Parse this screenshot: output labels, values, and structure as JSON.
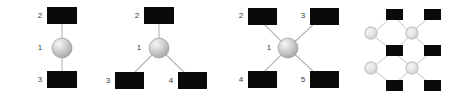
{
  "figure": {
    "background_color": "#ffffff",
    "square_color": "#0a0a0a",
    "sphere_color": "#c9c9c9",
    "sphere_highlight_color": "#f2f2f2",
    "ring_color": "#cfcfcf",
    "ring_fill_color": "#ebebeb",
    "bond_color": "#b4b4b4",
    "label_color": "#3a3a3a"
  },
  "panels": [
    {
      "id": "panel-linear",
      "name": "linear-two-coordinate",
      "geometry": "linear",
      "center_label": "1",
      "ligand_labels": [
        "2",
        "3"
      ],
      "node_count": 3,
      "nodes": [
        {
          "label": "2",
          "shape": "square",
          "x": 62,
          "y": 16,
          "label_x": 42,
          "label_y": 16
        },
        {
          "label": "1",
          "shape": "sphere",
          "x": 62,
          "y": 48,
          "label_x": 42,
          "label_y": 48
        },
        {
          "label": "3",
          "shape": "square",
          "x": 62,
          "y": 79,
          "label_x": 42,
          "label_y": 79
        }
      ],
      "bonds": [
        {
          "from": "1",
          "to": "2"
        },
        {
          "from": "1",
          "to": "3"
        }
      ]
    },
    {
      "id": "panel-trigonal",
      "name": "trigonal-three-coordinate",
      "geometry": "trigonal",
      "center_label": "1",
      "ligand_labels": [
        "2",
        "3",
        "4"
      ],
      "node_count": 4,
      "nodes": [
        {
          "label": "2",
          "shape": "square",
          "x": 159,
          "y": 16,
          "label_x": 139,
          "label_y": 16
        },
        {
          "label": "1",
          "shape": "sphere",
          "x": 159,
          "y": 48,
          "label_x": 139,
          "label_y": 48
        },
        {
          "label": "3",
          "shape": "square",
          "x": 128,
          "y": 80,
          "label_x": 108,
          "label_y": 80
        },
        {
          "label": "4",
          "shape": "square",
          "x": 192,
          "y": 80,
          "label_x": 172,
          "label_y": 80
        }
      ],
      "bonds": [
        {
          "from": "1",
          "to": "2"
        },
        {
          "from": "1",
          "to": "3"
        },
        {
          "from": "1",
          "to": "4"
        }
      ]
    },
    {
      "id": "panel-tetrahedral",
      "name": "tetrahedral-four-coordinate",
      "geometry": "tetrahedral",
      "center_label": "1",
      "ligand_labels": [
        "2",
        "3",
        "4",
        "5"
      ],
      "node_count": 5,
      "nodes": [
        {
          "label": "2",
          "shape": "square",
          "x": 260,
          "y": 16,
          "label_x": 241,
          "label_y": 16
        },
        {
          "label": "3",
          "shape": "square",
          "x": 322,
          "y": 16,
          "label_x": 303,
          "label_y": 16
        },
        {
          "label": "1",
          "shape": "sphere",
          "x": 291,
          "y": 48,
          "label_x": 271,
          "label_y": 48
        },
        {
          "label": "4",
          "shape": "square",
          "x": 260,
          "y": 80,
          "label_x": 241,
          "label_y": 80
        },
        {
          "label": "5",
          "shape": "square",
          "x": 322,
          "y": 80,
          "label_x": 303,
          "label_y": 80
        }
      ],
      "bonds": [
        {
          "from": "1",
          "to": "2"
        },
        {
          "from": "1",
          "to": "3"
        },
        {
          "from": "1",
          "to": "4"
        },
        {
          "from": "1",
          "to": "5"
        }
      ]
    },
    {
      "id": "panel-lattice",
      "name": "extended-lattice-network",
      "geometry": "lattice",
      "center_label": "",
      "ligand_labels": [],
      "node_count": 12,
      "nodes": [
        {
          "label": "",
          "shape": "square",
          "x": 394,
          "y": 15
        },
        {
          "label": "",
          "shape": "square",
          "x": 432,
          "y": 15
        },
        {
          "label": "",
          "shape": "ring",
          "x": 372,
          "y": 33
        },
        {
          "label": "",
          "shape": "ring",
          "x": 412,
          "y": 33
        },
        {
          "label": "",
          "shape": "square",
          "x": 394,
          "y": 51
        },
        {
          "label": "",
          "shape": "square",
          "x": 432,
          "y": 51
        },
        {
          "label": "",
          "shape": "ring",
          "x": 372,
          "y": 68
        },
        {
          "label": "",
          "shape": "ring",
          "x": 412,
          "y": 68
        },
        {
          "label": "",
          "shape": "square",
          "x": 394,
          "y": 85
        },
        {
          "label": "",
          "shape": "square",
          "x": 432,
          "y": 85
        }
      ],
      "bonds": [
        {
          "from": "r1",
          "to": "s1"
        },
        {
          "from": "r2",
          "to": "s1"
        },
        {
          "from": "r2",
          "to": "s2"
        },
        {
          "from": "r1",
          "to": "s3"
        },
        {
          "from": "r2",
          "to": "s3"
        },
        {
          "from": "r3",
          "to": "s3"
        },
        {
          "from": "r4",
          "to": "s3"
        },
        {
          "from": "r4",
          "to": "s4"
        },
        {
          "from": "r3",
          "to": "s5"
        },
        {
          "from": "r4",
          "to": "s5"
        },
        {
          "from": "r4",
          "to": "s6"
        }
      ]
    }
  ]
}
